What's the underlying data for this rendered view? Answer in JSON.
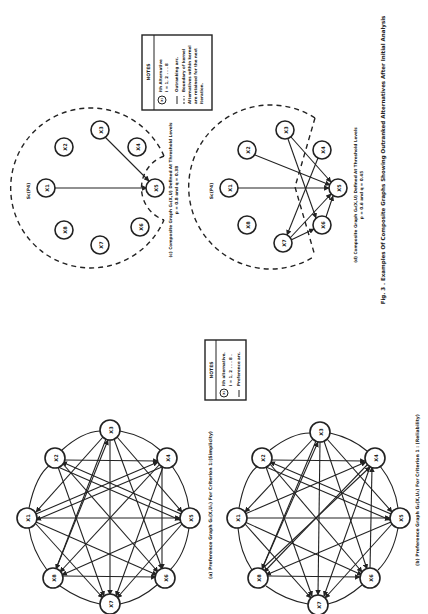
{
  "figure": {
    "title": "Fig. 3 . Examples Of Composite Graphs Showing Outranked Alternatives After Initial Analysis"
  },
  "panels": {
    "a": {
      "caption": "(a) Preference Graph G₁(X,U₁) For Criterion 1:(Simplicity)",
      "nodes": [
        "X1",
        "X2",
        "X3",
        "X4",
        "X5",
        "X6",
        "X7",
        "X8"
      ]
    },
    "b": {
      "caption": "(b) Preference Graph G₂(X,U₂) For Criterion 1 : (Reliability)",
      "nodes": [
        "X1",
        "X2",
        "X3",
        "X4",
        "X5",
        "X6",
        "X7",
        "X8"
      ]
    },
    "c": {
      "caption_line1": "(c) Composite Graph G₀(X,U) Defined At Threshold Levels",
      "caption_line2": "p = 0.8 and q = 0.38",
      "label": "Sc(P4)",
      "nodes": [
        "X1",
        "X2",
        "X3",
        "X4",
        "X5",
        "X6",
        "X7",
        "X8"
      ],
      "arcs": [
        [
          "X1",
          "X5"
        ],
        [
          "X3",
          "X5"
        ]
      ]
    },
    "d": {
      "caption_line1": "(d) Composite Graph G₀(X,U) Defined At Threshold Levels",
      "caption_line2": "p = 0.6 and q = 0.45",
      "label": "Sc(P4)",
      "nodes": [
        "X1",
        "X2",
        "X3",
        "X4",
        "X5",
        "X6",
        "X7",
        "X8"
      ],
      "arcs": [
        [
          "X1",
          "X5"
        ],
        [
          "X2",
          "X5"
        ],
        [
          "X3",
          "X5"
        ],
        [
          "X3",
          "X6"
        ],
        [
          "X4",
          "X7"
        ],
        [
          "X6",
          "X5"
        ],
        [
          "X7",
          "X5"
        ],
        [
          "X7",
          "X6"
        ]
      ]
    }
  },
  "notes_a": {
    "title": "NOTES",
    "symbol": "Xi",
    "line1": "ith alternative.",
    "line2": "i = 1, 2 . . . 8 .",
    "line3": "Preference arc."
  },
  "notes_c": {
    "title": "NOTES",
    "symbol": "Xi",
    "line1": "ith Alternative",
    "line2": "i = 1, 2 . . . 8",
    "line3": "Outranking arc.",
    "line4": "Boundary of kernel",
    "line5": "Alternatives within kernel",
    "line6": "are retained for the next",
    "line7": "iteration."
  }
}
